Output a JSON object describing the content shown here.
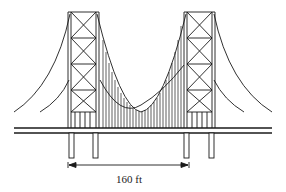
{
  "diagram": {
    "type": "suspension-bridge",
    "stroke_color": "#1a1a1a",
    "background": "#ffffff",
    "dimension": {
      "label": "160 ft",
      "from_x": 69,
      "to_x": 189
    },
    "towers": [
      {
        "name": "left-tower",
        "x_left": 68,
        "x_right": 99
      },
      {
        "name": "right-tower",
        "x_left": 184,
        "x_right": 215
      }
    ],
    "deck": {
      "y_top": 128,
      "y_bottom": 133,
      "x_start": 14,
      "x_end": 272
    }
  }
}
